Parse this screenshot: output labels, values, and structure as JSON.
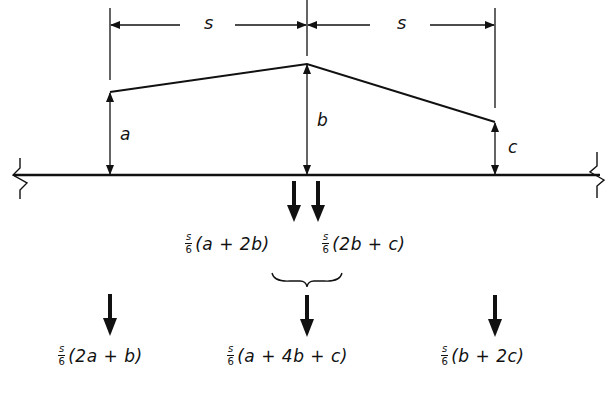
{
  "diagram": {
    "dimensions": {
      "left_span": "s",
      "right_span": "s"
    },
    "ordinates": {
      "left": "a",
      "middle": "b",
      "right": "c"
    },
    "intermediate_loads": [
      {
        "fraction_num": "s",
        "fraction_den": "6",
        "expr": "(a + 2b)"
      },
      {
        "fraction_num": "s",
        "fraction_den": "6",
        "expr": "(2b + c)"
      }
    ],
    "resultant_loads": [
      {
        "fraction_num": "s",
        "fraction_den": "6",
        "expr": "(2a + b)"
      },
      {
        "fraction_num": "s",
        "fraction_den": "6",
        "expr": "(a + 4b + c)"
      },
      {
        "fraction_num": "s",
        "fraction_den": "6",
        "expr": "(b + 2c)"
      }
    ],
    "colors": {
      "ink": "#111111",
      "background": "#ffffff"
    }
  }
}
